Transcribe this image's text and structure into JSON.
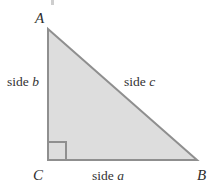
{
  "figure": {
    "type": "right-triangle-diagram",
    "background_color": "#ffffff",
    "fill_color": "#dddddd",
    "stroke_color": "#8f8f8f",
    "vertices": {
      "a": "A",
      "b": "B",
      "c": "C"
    },
    "sides": {
      "a_label": "side ",
      "a_var": "a",
      "b_label": "side ",
      "b_var": "b",
      "c_label": "side ",
      "c_var": "c"
    },
    "right_angle_at": "C",
    "geometry": {
      "apex_a": [
        48,
        29
      ],
      "corner_c": [
        48,
        160
      ],
      "corner_b": [
        197,
        160
      ],
      "right_angle_mark_size": 18
    }
  }
}
